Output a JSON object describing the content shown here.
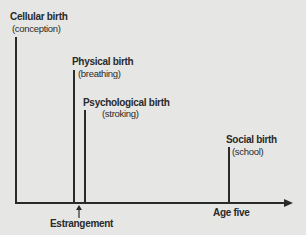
{
  "diagram": {
    "events": [
      {
        "title": "Cellular birth",
        "subtitle": "(conception)"
      },
      {
        "title": "Physical birth",
        "subtitle": "(breathing)"
      },
      {
        "title": "Psychological birth",
        "subtitle": "(stroking)"
      },
      {
        "title": "Social birth",
        "subtitle": "(school)"
      }
    ],
    "axis_labels": {
      "estrangement": "Estrangement",
      "age_five": "Age five"
    },
    "colors": {
      "background": "#e6e6e4",
      "ink": "#2a2a2a"
    }
  }
}
